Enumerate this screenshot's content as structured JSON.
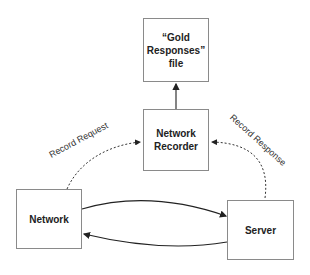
{
  "nodes": {
    "gold": {
      "line1": "“Gold",
      "line2": "Responses”",
      "line3": "file"
    },
    "recorder": {
      "line1": "Network",
      "line2": "Recorder"
    },
    "network": {
      "label": "Network"
    },
    "server": {
      "label": "Server"
    }
  },
  "edges": {
    "record_request": "Record Request",
    "record_response": "Record Response"
  }
}
